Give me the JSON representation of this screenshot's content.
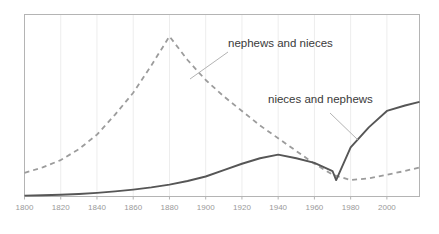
{
  "chart_data": {
    "type": "line",
    "title": "",
    "xlabel": "",
    "ylabel": "",
    "xlim": [
      1800,
      2018
    ],
    "ylim": [
      0,
      100
    ],
    "grid": true,
    "grid_axis": "x",
    "legend": "inline-annotations",
    "xticks": [
      1800,
      1820,
      1840,
      1860,
      1880,
      1900,
      1920,
      1940,
      1960,
      1980,
      2000
    ],
    "xtick_labels": [
      "1800",
      "1820",
      "1840",
      "1860",
      "1880",
      "1900",
      "1920",
      "1940",
      "1960",
      "1980",
      "2000"
    ],
    "yticks": [],
    "ytick_labels": [],
    "series": [
      {
        "name": "nephews and nieces",
        "style": "dashed",
        "color": "#9c9c9c",
        "annotation": "nephews and nieces",
        "x": [
          1800,
          1810,
          1820,
          1830,
          1840,
          1850,
          1860,
          1870,
          1880,
          1890,
          1900,
          1910,
          1920,
          1930,
          1940,
          1950,
          1960,
          1970,
          1980,
          1990,
          2000,
          2010,
          2018
        ],
        "values": [
          13,
          16,
          20,
          26,
          34,
          45,
          57,
          72,
          88,
          75,
          64,
          55,
          47,
          39,
          32,
          25,
          18,
          12,
          9,
          10,
          12,
          14,
          16
        ]
      },
      {
        "name": "nieces and nephews",
        "style": "solid",
        "color": "#565656",
        "annotation": "nieces and nephews",
        "x": [
          1800,
          1810,
          1820,
          1830,
          1840,
          1850,
          1860,
          1870,
          1880,
          1890,
          1900,
          1910,
          1920,
          1930,
          1940,
          1950,
          1960,
          1970,
          1972,
          1980,
          1990,
          2000,
          2010,
          2018
        ],
        "values": [
          0.5,
          0.7,
          1,
          1.4,
          2,
          2.8,
          3.8,
          5,
          6.5,
          8.5,
          11,
          14.5,
          18,
          21,
          23,
          21,
          18.5,
          14,
          9,
          27,
          38,
          47,
          50,
          52
        ]
      }
    ],
    "annotations": [
      {
        "text": "nephews and nieces",
        "text_x": 228,
        "text_y": 47,
        "leader_from_x": 190,
        "leader_from_y": 79,
        "leader_to_x": 228,
        "leader_to_y": 52
      },
      {
        "text": "nieces and nephews",
        "text_x": 268,
        "text_y": 103,
        "leader_from_x": 358,
        "leader_from_y": 140,
        "leader_to_x": 330,
        "leader_to_y": 113
      }
    ],
    "colors": {
      "solid_line": "#565656",
      "dashed_line": "#9c9c9c",
      "frame": "#b4b4b4",
      "gridline": "#ededed",
      "tick_label": "#9a9a9a",
      "annotation_text": "#3a3a3a",
      "leader_line": "#aaaaaa",
      "background": "#ffffff"
    }
  }
}
